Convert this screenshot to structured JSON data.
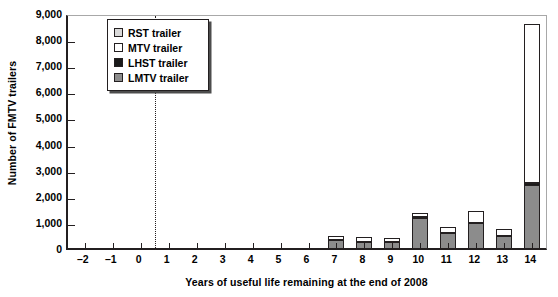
{
  "chart_data": {
    "type": "bar",
    "subtype": "stacked-column",
    "title": "",
    "xlabel": "Years of useful life remaining at the end of 2008",
    "ylabel": "Number of FMTV trailers",
    "categories": [
      "-2",
      "-1",
      "0",
      "1",
      "2",
      "3",
      "4",
      "5",
      "6",
      "7",
      "8",
      "9",
      "10",
      "11",
      "12",
      "13",
      "14"
    ],
    "xlim": [
      -2.6,
      14.6
    ],
    "ylim": [
      0,
      9000
    ],
    "yticks": [
      0,
      1000,
      2000,
      3000,
      4000,
      5000,
      6000,
      7000,
      8000,
      9000
    ],
    "ytick_labels": [
      "0",
      "1,000",
      "2,000",
      "3,000",
      "4,000",
      "5,000",
      "6,000",
      "7,000",
      "8,000",
      "9,000"
    ],
    "grid": false,
    "legend_position": "upper-left-inset",
    "reference_line": {
      "axis": "x",
      "value": 0.5,
      "style": "dotted",
      "color": "#231f20"
    },
    "series": [
      {
        "name": "LMTV trailer",
        "color": "#8c8c8c",
        "values": [
          0,
          0,
          0,
          0,
          0,
          0,
          0,
          0,
          0,
          350,
          280,
          250,
          1200,
          600,
          1000,
          500,
          2450
        ]
      },
      {
        "name": "LHST trailer",
        "color": "#1a1a1a",
        "values": [
          0,
          0,
          0,
          0,
          0,
          0,
          0,
          0,
          0,
          0,
          0,
          0,
          60,
          0,
          0,
          0,
          110
        ]
      },
      {
        "name": "MTV trailer",
        "color": "#ffffff",
        "values": [
          0,
          0,
          0,
          0,
          0,
          0,
          0,
          0,
          0,
          150,
          170,
          170,
          150,
          230,
          450,
          250,
          6090
        ]
      },
      {
        "name": "RST trailer",
        "color": "#d9d9d9",
        "values": [
          0,
          0,
          0,
          0,
          0,
          0,
          0,
          0,
          0,
          0,
          0,
          0,
          0,
          0,
          0,
          0,
          0
        ]
      }
    ],
    "totals": [
      0,
      0,
      0,
      0,
      0,
      0,
      0,
      0,
      0,
      500,
      450,
      420,
      1410,
      830,
      1450,
      750,
      8650
    ]
  },
  "legend": {
    "items": [
      {
        "label": "RST trailer",
        "color": "#d9d9d9",
        "swatch_name": "legend-swatch-rst"
      },
      {
        "label": "MTV trailer",
        "color": "#ffffff",
        "swatch_name": "legend-swatch-mtv"
      },
      {
        "label": "LHST trailer",
        "color": "#1a1a1a",
        "swatch_name": "legend-swatch-lhst"
      },
      {
        "label": "LMTV trailer",
        "color": "#8c8c8c",
        "swatch_name": "legend-swatch-lmtv"
      }
    ]
  },
  "axes": {
    "y_title": "Number of FMTV trailers",
    "x_title": "Years of useful life remaining at the end of 2008"
  }
}
